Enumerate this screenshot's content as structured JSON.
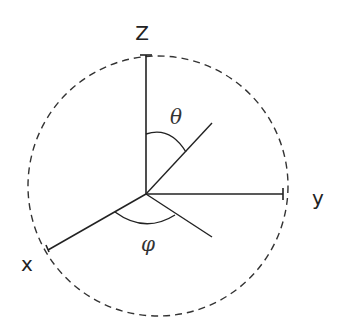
{
  "diagram": {
    "axes": {
      "z": "Z",
      "y": "y",
      "x": "x"
    },
    "angles": {
      "polar": "θ",
      "azimuth": "φ"
    },
    "colors": {
      "stroke": "#222222",
      "background": "#ffffff"
    }
  }
}
